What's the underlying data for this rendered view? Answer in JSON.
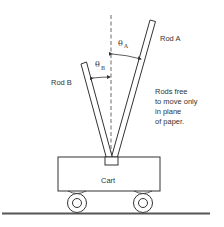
{
  "diagram": {
    "rod_a": {
      "label": "Rod A",
      "angle_label": "θ",
      "angle_subscript": "A"
    },
    "rod_b": {
      "label": "Rod B",
      "angle_label": "θ",
      "angle_subscript": "B"
    },
    "cart": {
      "label": "Cart"
    },
    "note": {
      "lines": [
        "Rods free",
        "to move only",
        "in plane",
        "of paper."
      ]
    },
    "colors": {
      "stroke": "#333333",
      "background": "#ffffff",
      "ground": "#555555"
    }
  }
}
